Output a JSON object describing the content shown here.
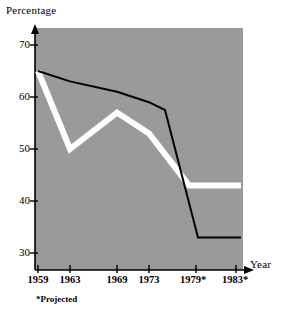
{
  "chart_data": {
    "type": "line",
    "title": "",
    "xlabel": "Year",
    "ylabel": "Percentage",
    "x": [
      "1959",
      "1963",
      "1969",
      "1973",
      "1979*",
      "1983*"
    ],
    "xtick_labels": [
      "1959",
      "1963",
      "1969",
      "1973",
      "1979*",
      "1983*"
    ],
    "ytick_labels": [
      "70",
      "60",
      "50",
      "40",
      "30"
    ],
    "ylim": [
      28,
      72
    ],
    "xlim": [
      1957,
      1985
    ],
    "grid": false,
    "legend": "inline-labels",
    "plot_background": "#9a9a9a",
    "series": [
      {
        "name": "Senate",
        "color": "#000000",
        "style": "thin-solid-black",
        "values": [
          65,
          63,
          61,
          59,
          33,
          33
        ],
        "points": [
          {
            "year": "1959",
            "value": 65
          },
          {
            "year": "1963",
            "value": 63
          },
          {
            "year": "1969",
            "value": 61
          },
          {
            "year": "1973",
            "value": 59
          },
          {
            "year": "1975",
            "value": 57.5
          },
          {
            "year": "1979*",
            "value": 33
          },
          {
            "year": "1983*",
            "value": 33
          }
        ]
      },
      {
        "name": "House",
        "color": "#ffffff",
        "style": "thick-solid-white",
        "values": [
          65,
          50,
          57,
          53,
          43,
          43
        ],
        "points": [
          {
            "year": "1959",
            "value": 65
          },
          {
            "year": "1963",
            "value": 50
          },
          {
            "year": "1969",
            "value": 57
          },
          {
            "year": "1973",
            "value": 53
          },
          {
            "year": "1978",
            "value": 43
          },
          {
            "year": "1979*",
            "value": 43
          },
          {
            "year": "1983*",
            "value": 43
          }
        ]
      }
    ],
    "annotations": [
      {
        "text": "Senate",
        "kind": "series-label"
      },
      {
        "text": "House",
        "kind": "series-label"
      },
      {
        "text": "*Projected",
        "kind": "footnote"
      }
    ],
    "footnote": "*Projected"
  },
  "colors": {
    "plot_bg": "#9a9a9a",
    "axis": "#000000",
    "senate": "#000000",
    "house": "#ffffff",
    "page_bg": "#ffffff"
  }
}
